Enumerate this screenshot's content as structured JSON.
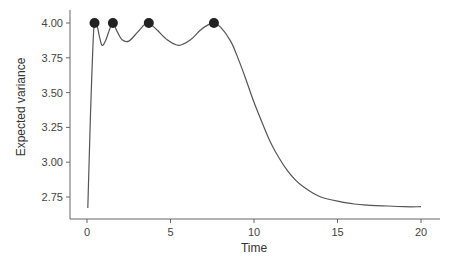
{
  "chart_data": {
    "type": "line",
    "title": "",
    "xlabel": "Time",
    "ylabel": "Expected variance",
    "xlim": [
      -1,
      21.1
    ],
    "ylim": [
      2.59,
      4.09
    ],
    "grid": false,
    "legend": null,
    "x_ticks": [
      0,
      5,
      10,
      15,
      20
    ],
    "x_tick_labels": [
      "0",
      "5",
      "10",
      "15",
      "20"
    ],
    "y_ticks": [
      2.75,
      3.0,
      3.25,
      3.5,
      3.75,
      4.0
    ],
    "y_tick_labels": [
      "2.75",
      "3.00",
      "3.25",
      "3.50",
      "3.75",
      "4.00"
    ],
    "series": [
      {
        "name": "Expected variance",
        "color": "#555555",
        "x": [
          0.05,
          0.2,
          0.4,
          0.55,
          0.75,
          0.9,
          1.1,
          1.4,
          1.55,
          1.8,
          2.1,
          2.5,
          3.0,
          3.45,
          3.7,
          4.2,
          4.8,
          5.5,
          6.2,
          6.8,
          7.3,
          7.6,
          8.0,
          8.6,
          9.0,
          9.5,
          10.0,
          10.5,
          11.0,
          11.5,
          12.0,
          12.5,
          13.0,
          13.5,
          14.0,
          15.0,
          16.0,
          17.0,
          18.0,
          19.0,
          20.0
        ],
        "values": [
          2.67,
          3.3,
          3.95,
          4.0,
          3.9,
          3.84,
          3.87,
          3.97,
          4.0,
          3.94,
          3.88,
          3.87,
          3.93,
          3.99,
          4.0,
          3.95,
          3.88,
          3.84,
          3.88,
          3.95,
          3.99,
          4.0,
          3.97,
          3.87,
          3.76,
          3.6,
          3.43,
          3.28,
          3.14,
          3.03,
          2.94,
          2.87,
          2.82,
          2.78,
          2.75,
          2.72,
          2.7,
          2.69,
          2.685,
          2.68,
          2.68
        ]
      }
    ],
    "markers": {
      "name": "Maxima",
      "color": "#222222",
      "x": [
        0.45,
        1.55,
        3.7,
        7.6
      ],
      "values": [
        4.0,
        4.0,
        4.0,
        4.0
      ]
    }
  }
}
